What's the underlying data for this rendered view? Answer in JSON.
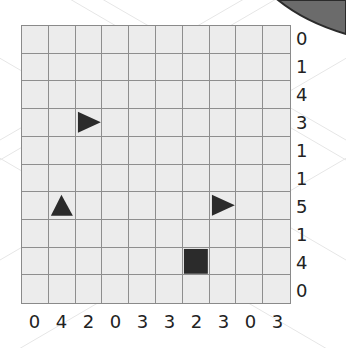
{
  "puzzle": {
    "rows": 10,
    "cols": 10,
    "row_clues": [
      "0",
      "1",
      "4",
      "3",
      "1",
      "1",
      "5",
      "1",
      "4",
      "0"
    ],
    "col_clues": [
      "0",
      "4",
      "2",
      "0",
      "3",
      "3",
      "2",
      "3",
      "0",
      "3"
    ],
    "pieces": [
      {
        "row": 3,
        "col": 2,
        "type": "triangle-right"
      },
      {
        "row": 6,
        "col": 1,
        "type": "triangle-up"
      },
      {
        "row": 6,
        "col": 7,
        "type": "triangle-right"
      },
      {
        "row": 8,
        "col": 6,
        "type": "square"
      }
    ]
  },
  "colors": {
    "cell_fill": "#ececec",
    "grid_line": "#8e8e8e",
    "piece": "#2b2b2b",
    "corner_arc": "#6b6b6b"
  }
}
